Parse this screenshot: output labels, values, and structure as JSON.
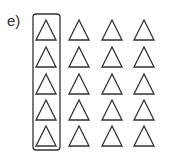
{
  "label": "e)",
  "grid": {
    "rows": 5,
    "cols": 4,
    "shape": "triangle-outline",
    "stroke_color": "#333333",
    "highlighted_column": 0
  },
  "layout": {
    "col_centers": [
      46,
      79,
      112,
      144
    ],
    "row_tops": [
      20,
      47,
      74,
      100,
      126
    ],
    "tri_height": 20,
    "tri_half_base": 10,
    "box": {
      "x": 33,
      "y": 14,
      "w": 27,
      "h": 136,
      "r": 3
    }
  }
}
